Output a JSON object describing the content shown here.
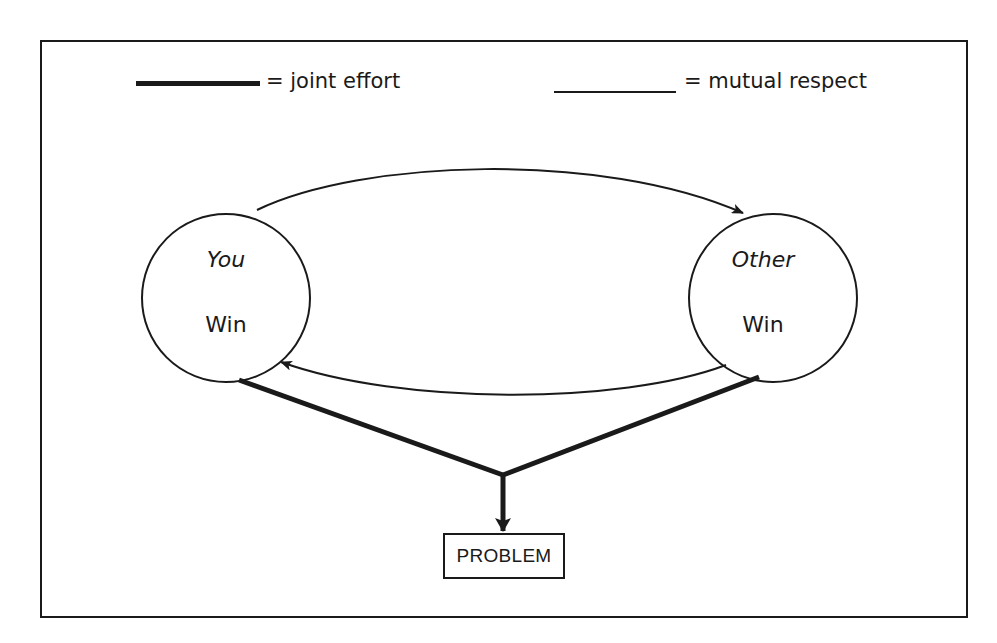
{
  "legend": {
    "joint_effort": {
      "symbol": "thick-line",
      "label": "= joint effort"
    },
    "mutual_respect": {
      "symbol": "thin-line",
      "label": "= mutual respect"
    }
  },
  "nodes": {
    "you": {
      "title": "You",
      "subtitle": "Win"
    },
    "other": {
      "title": "Other",
      "subtitle": "Win"
    },
    "problem": {
      "label": "PROBLEM"
    }
  },
  "edges": [
    {
      "from": "You",
      "to": "Other",
      "type": "mutual respect",
      "style": "thin arrow (top arc)"
    },
    {
      "from": "Other",
      "to": "You",
      "type": "mutual respect",
      "style": "thin arrow (bottom arc)"
    },
    {
      "from": "You",
      "to": "PROBLEM",
      "type": "joint effort",
      "style": "thick line"
    },
    {
      "from": "Other",
      "to": "PROBLEM",
      "type": "joint effort",
      "style": "thick line"
    }
  ],
  "colors": {
    "stroke": "#1a1a1a",
    "background": "#ffffff"
  }
}
